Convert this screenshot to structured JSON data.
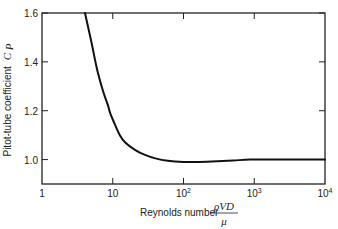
{
  "chart_data": {
    "type": "line",
    "title": "",
    "xlabel": "Reynolds number",
    "xlabel_fraction": {
      "numerator": "ρVD",
      "denominator": "μ"
    },
    "ylabel": "Pitot-tube coefficient",
    "ylabel_symbol": "C",
    "ylabel_subscript": "P",
    "xscale": "log",
    "xlim": [
      1,
      10000
    ],
    "ylim": [
      0.9,
      1.6
    ],
    "grid": false,
    "legend": "none",
    "x_ticks": [
      {
        "value": 1,
        "label": "1",
        "sup": ""
      },
      {
        "value": 10,
        "label": "10",
        "sup": ""
      },
      {
        "value": 100,
        "label": "10",
        "sup": "2"
      },
      {
        "value": 1000,
        "label": "10",
        "sup": "3"
      },
      {
        "value": 10000,
        "label": "10",
        "sup": "4"
      }
    ],
    "y_ticks": [
      {
        "value": 1.0,
        "label": "1.0"
      },
      {
        "value": 1.2,
        "label": "1.2"
      },
      {
        "value": 1.4,
        "label": "1.4"
      },
      {
        "value": 1.6,
        "label": "1.6"
      }
    ],
    "series": [
      {
        "name": "Pitot-tube coefficient",
        "color": "#111111",
        "x": [
          4.05,
          5.0,
          6.0,
          7.3,
          8.6,
          9.2,
          10.5,
          12.6,
          15,
          20.6,
          28,
          40,
          60,
          100,
          150,
          250,
          500,
          870,
          2000,
          5000,
          10000
        ],
        "y": [
          1.6,
          1.48,
          1.37,
          1.28,
          1.22,
          1.19,
          1.15,
          1.1,
          1.07,
          1.04,
          1.02,
          1.005,
          0.995,
          0.99,
          0.99,
          0.992,
          0.996,
          1.0,
          1.0,
          1.0,
          1.0
        ]
      }
    ]
  }
}
